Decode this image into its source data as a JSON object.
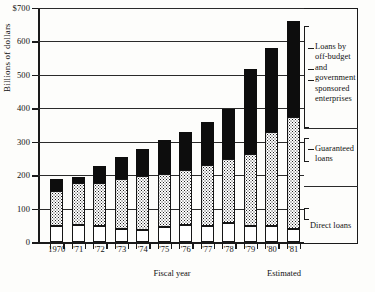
{
  "figure": {
    "y_axis_title": "Billions of dollars",
    "x_axis_title": "Fiscal year",
    "estimated_note": "Estimated"
  },
  "legend": {
    "offbudget": "Loans by\noff-budget\nand government\nsponsored\nenterprises",
    "guaranteed": "Guaranteed\nloans",
    "direct": "Direct loans"
  },
  "yticks": [
    {
      "label": "$700",
      "value": 700
    },
    {
      "label": "600",
      "value": 600
    },
    {
      "label": "500",
      "value": 500
    },
    {
      "label": "400",
      "value": 400
    },
    {
      "label": "300",
      "value": 300
    },
    {
      "label": "200",
      "value": 200
    },
    {
      "label": "100",
      "value": 100
    },
    {
      "label": "0",
      "value": 0
    }
  ],
  "colors": {
    "direct": "#ffffff",
    "guaranteed": "#ffffff-dotted",
    "offbudget": "#0d0d0d",
    "axis": "#1a1a1a"
  },
  "chart_data": {
    "type": "bar",
    "title": "",
    "subtitle": "",
    "xlabel": "Fiscal year",
    "ylabel": "Billions of dollars",
    "ylim": [
      0,
      700
    ],
    "grid": true,
    "stacked": true,
    "legend_position": "right",
    "categories": [
      "1970",
      "'71",
      "'72",
      "'73",
      "'74",
      "'75",
      "'76",
      "'77",
      "'78",
      "'79",
      "'80",
      "'81"
    ],
    "tick_labels": [
      "1970",
      "'71",
      "'72",
      "'73",
      "'74",
      "'75",
      "'76",
      "'77",
      "'78",
      "'79",
      "'80",
      "'81"
    ],
    "series": [
      {
        "name": "Direct loans",
        "values": [
          50,
          53,
          50,
          40,
          38,
          45,
          53,
          50,
          58,
          48,
          50,
          40
        ]
      },
      {
        "name": "Guaranteed loans",
        "values": [
          105,
          125,
          128,
          150,
          160,
          160,
          162,
          180,
          190,
          215,
          280,
          335
        ]
      },
      {
        "name": "Loans by off-budget and government sponsored enterprises",
        "values": [
          35,
          18,
          50,
          65,
          80,
          100,
          115,
          130,
          150,
          255,
          250,
          285
        ]
      }
    ],
    "totals": [
      190,
      196,
      228,
      255,
      278,
      305,
      330,
      360,
      398,
      518,
      580,
      660
    ],
    "annotations": [
      {
        "text": "Estimated",
        "x_range": [
          "'80",
          "'81"
        ]
      }
    ]
  }
}
